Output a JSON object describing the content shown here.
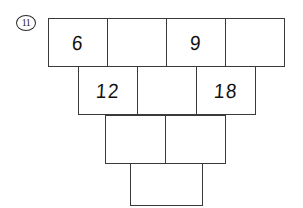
{
  "worksheet": {
    "problem_number": "11",
    "pyramid": {
      "rows": [
        {
          "row_index": 1,
          "cells": [
            {
              "value": "6",
              "filled": true
            },
            {
              "value": "",
              "filled": false
            },
            {
              "value": "9",
              "filled": true
            },
            {
              "value": "",
              "filled": false
            }
          ]
        },
        {
          "row_index": 2,
          "cells": [
            {
              "value": "12",
              "filled": true
            },
            {
              "value": "",
              "filled": false
            },
            {
              "value": "18",
              "filled": true
            }
          ]
        },
        {
          "row_index": 3,
          "cells": [
            {
              "value": "",
              "filled": false
            },
            {
              "value": "",
              "filled": false
            }
          ]
        },
        {
          "row_index": 4,
          "cells": [
            {
              "value": "",
              "filled": false
            }
          ]
        }
      ]
    },
    "colors": {
      "ink": "#111111",
      "rule": "#3a3a3a",
      "paper": "#ffffff"
    }
  }
}
